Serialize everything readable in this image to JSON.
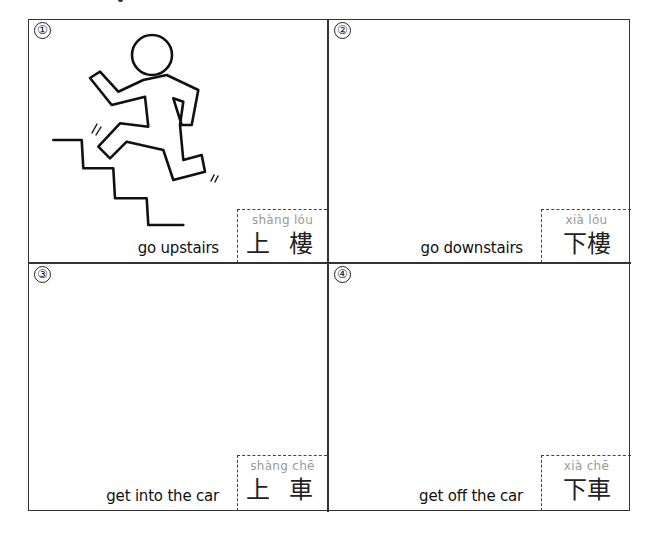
{
  "worksheet": {
    "panels": [
      {
        "number": "①",
        "english": "go upstairs",
        "pinyin": "shàng lóu",
        "hanzi": "上 樓",
        "has_illustration": true,
        "illustration": "stick-figure-running-up-stairs"
      },
      {
        "number": "②",
        "english": "go downstairs",
        "pinyin": "xià lóu",
        "hanzi": "下樓",
        "has_illustration": false
      },
      {
        "number": "③",
        "english": "get into the car",
        "pinyin": "shàng chē",
        "hanzi": "上 車",
        "has_illustration": false
      },
      {
        "number": "④",
        "english": "get off the car",
        "pinyin": "xià chē",
        "hanzi": "下車",
        "has_illustration": false
      }
    ]
  },
  "colors": {
    "border": "#333333",
    "text": "#111111",
    "pinyin": "#9a9a9a",
    "background": "#ffffff"
  }
}
